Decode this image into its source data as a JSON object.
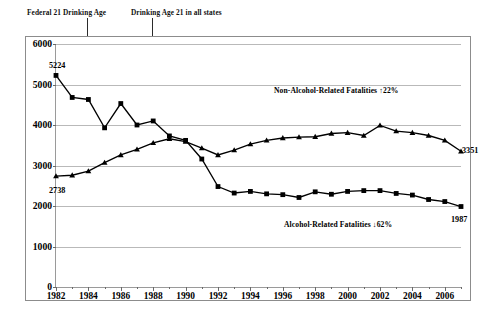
{
  "annotations": {
    "federal_line_label": "Federal 21 Drinking Age",
    "all_states_line_label": "Drinking Age 21 in all states",
    "nonalcohol_note": "Non-Alcohol-Related Fatalities ↑22%",
    "alcohol_note": "Alcohol-Related Fatalities ↓62%",
    "federal_line_year": 1984,
    "all_states_line_year": 1988
  },
  "point_labels": {
    "alcohol_start": "5224",
    "alcohol_end": "1987",
    "nonalcohol_start": "2738",
    "nonalcohol_end": "3351"
  },
  "caption": "",
  "colors": {
    "series": "#000000",
    "grid": "#b9b9b9",
    "axis": "#9a9a9a",
    "frame": "#8c8c8c",
    "annotation_line": "#2b2b2b"
  },
  "chart_data": {
    "type": "line",
    "title": "",
    "xlabel": "",
    "ylabel": "",
    "xlim": [
      1982,
      2007
    ],
    "ylim": [
      0,
      6000
    ],
    "grid": true,
    "legend": "inline-annotation",
    "yticks": [
      0,
      1000,
      2000,
      3000,
      4000,
      5000,
      6000
    ],
    "xticks": [
      1982,
      1984,
      1986,
      1988,
      1990,
      1992,
      1994,
      1996,
      1998,
      2000,
      2002,
      2004,
      2006
    ],
    "x": [
      1982,
      1983,
      1984,
      1985,
      1986,
      1987,
      1988,
      1989,
      1990,
      1991,
      1992,
      1993,
      1994,
      1995,
      1996,
      1997,
      1998,
      1999,
      2000,
      2001,
      2002,
      2003,
      2004,
      2005,
      2006,
      2007
    ],
    "series": [
      {
        "name": "Alcohol-Related Fatalities",
        "marker": "square",
        "values": [
          5224,
          4680,
          4630,
          3930,
          4530,
          4000,
          4100,
          3730,
          3620,
          3160,
          2480,
          2320,
          2360,
          2300,
          2280,
          2210,
          2350,
          2290,
          2360,
          2380,
          2380,
          2310,
          2270,
          2160,
          2110,
          1987
        ]
      },
      {
        "name": "Non-Alcohol-Related Fatalities",
        "marker": "triangle",
        "values": [
          2738,
          2760,
          2860,
          3070,
          3260,
          3400,
          3560,
          3660,
          3590,
          3430,
          3260,
          3380,
          3530,
          3620,
          3680,
          3700,
          3710,
          3790,
          3810,
          3740,
          3990,
          3850,
          3810,
          3740,
          3620,
          3351
        ]
      }
    ]
  }
}
